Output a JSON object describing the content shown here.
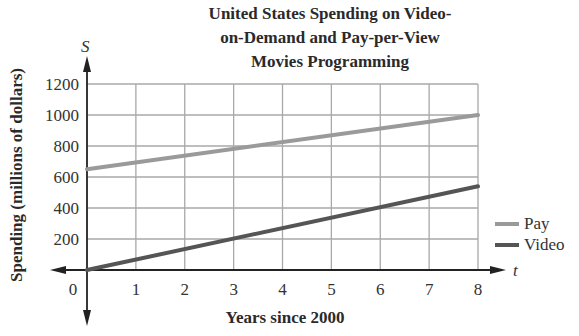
{
  "chart_data": {
    "type": "line",
    "title_lines": [
      "United States Spending on Video-",
      "on-Demand and Pay-per-View",
      "Movies Programming"
    ],
    "xlabel": "Years since 2000",
    "ylabel": "Spending (millions of dollars)",
    "x_axis_var": "t",
    "y_axis_var": "S",
    "x": [
      0,
      8
    ],
    "xlim": [
      0,
      8
    ],
    "ylim": [
      0,
      1200
    ],
    "x_ticks": [
      "0",
      "1",
      "2",
      "3",
      "4",
      "5",
      "6",
      "7",
      "8"
    ],
    "y_ticks": [
      "200",
      "400",
      "600",
      "800",
      "1000",
      "1200"
    ],
    "grid": true,
    "legend_position": "right",
    "series": [
      {
        "name": "Pay",
        "values": [
          650,
          1000
        ],
        "color": "#9a9a9a"
      },
      {
        "name": "Video",
        "values": [
          0,
          540
        ],
        "color": "#555555"
      }
    ]
  },
  "legend": {
    "pay": "Pay",
    "video": "Video"
  }
}
